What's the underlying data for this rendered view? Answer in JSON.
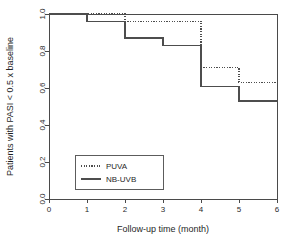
{
  "chart_data": {
    "type": "line",
    "subtype": "kaplan-meier-step",
    "title": "",
    "xlabel": "Follow-up time (month)",
    "ylabel": "Patients with PASI < 0.5 x baseline",
    "xlim": [
      0,
      6
    ],
    "ylim": [
      0.0,
      1.0
    ],
    "xticks": [
      "0",
      "1",
      "2",
      "3",
      "4",
      "5",
      "6"
    ],
    "xtick_values": [
      0,
      1,
      2,
      3,
      4,
      5,
      6
    ],
    "yticks": [
      "0.0",
      "0.2",
      "0.4",
      "0.6",
      "0.8",
      "1.0"
    ],
    "ytick_values": [
      0.0,
      0.2,
      0.4,
      0.6,
      0.8,
      1.0
    ],
    "grid": false,
    "legend_position": "bottom-left-inside",
    "x": [
      0,
      1,
      2,
      3,
      4,
      5,
      6
    ],
    "series": [
      {
        "name": "PUVA",
        "style": "dotted",
        "color": "#4d4d4d",
        "values": [
          1.0,
          1.0,
          1.0,
          0.96,
          0.96,
          0.71,
          0.63
        ],
        "steps": [
          {
            "from": 0,
            "to": 2,
            "value": 1.0
          },
          {
            "from": 2,
            "to": 4,
            "value": 0.96
          },
          {
            "from": 4,
            "to": 5,
            "value": 0.71
          },
          {
            "from": 5,
            "to": 6,
            "value": 0.63
          }
        ]
      },
      {
        "name": "NB-UVB",
        "style": "solid",
        "color": "#4d4d4d",
        "values": [
          1.0,
          1.0,
          0.96,
          0.87,
          0.83,
          0.61,
          0.53
        ],
        "steps": [
          {
            "from": 0,
            "to": 1,
            "value": 1.0
          },
          {
            "from": 1,
            "to": 2,
            "value": 0.96
          },
          {
            "from": 2,
            "to": 3,
            "value": 0.87
          },
          {
            "from": 3,
            "to": 4,
            "value": 0.83
          },
          {
            "from": 4,
            "to": 5,
            "value": 0.61
          },
          {
            "from": 5,
            "to": 6,
            "value": 0.53
          }
        ]
      }
    ],
    "legend": [
      {
        "label": "PUVA",
        "style": "dotted"
      },
      {
        "label": "NB-UVB",
        "style": "solid"
      }
    ]
  }
}
